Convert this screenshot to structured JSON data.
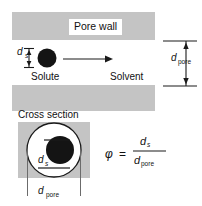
{
  "figure": {
    "type": "schematic-diagram",
    "colors": {
      "wall_gray": "#c4c4c4",
      "cross_section_gray": "#c4c4c4",
      "particle_black": "#141414",
      "line_black": "#1a1a1a",
      "background": "#ffffff"
    }
  },
  "top_view": {
    "pore_wall_label": "Pore wall",
    "solute_label": "Solute",
    "solvent_label": "Solvent",
    "ds_symbol": "d",
    "ds_subscript": "s",
    "dpore_symbol": "d",
    "dpore_subscript": "pore",
    "flow_arrow": "arrow-right-icon",
    "solute_particle": "solute-particle-icon"
  },
  "cross_section": {
    "title": "Cross section",
    "ds_symbol": "d",
    "ds_subscript": "s",
    "dpore_symbol": "d",
    "dpore_subscript": "pore"
  },
  "formula": {
    "phi": "φ",
    "equals": "=",
    "numerator_symbol": "d",
    "numerator_subscript": "s",
    "denominator_symbol": "d",
    "denominator_subscript": "pore",
    "expression": "φ = d_s / d_pore"
  }
}
